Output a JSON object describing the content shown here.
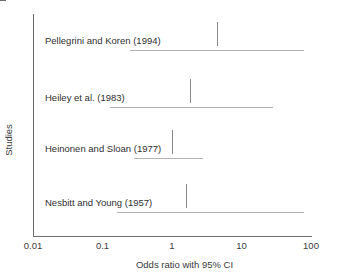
{
  "chart_data": {
    "type": "bar",
    "plot_kind": "forest-plot",
    "title": "",
    "xlabel": "Odds ratio with 95% CI",
    "ylabel": "Studies",
    "xscale": "log",
    "xlim": [
      0.01,
      100
    ],
    "xticks": [
      "0.01",
      "0.1",
      "1",
      "10",
      "100"
    ],
    "xtick_values": [
      0.01,
      0.1,
      1,
      100
    ],
    "grid": false,
    "legend": false,
    "categories": [
      "Pellegrini and Koren (1994)",
      "Heiley et al. (1983)",
      "Heinonen and Sloan (1977)",
      "Nesbitt and Young (1957)"
    ],
    "values": [
      4.5,
      1.8,
      1.0,
      1.6
    ],
    "series": [
      {
        "name": "Odds ratio with 95% CI",
        "points": [
          {
            "study": "Pellegrini and Koren (1994)",
            "odds_ratio": 4.5,
            "ci_low": 0.25,
            "ci_high": 80
          },
          {
            "study": "Heiley et al. (1983)",
            "odds_ratio": 1.8,
            "ci_low": 0.13,
            "ci_high": 28
          },
          {
            "study": "Heinonen and Sloan (1977)",
            "odds_ratio": 1.0,
            "ci_low": 0.28,
            "ci_high": 2.8
          },
          {
            "study": "Nesbitt and Young (1957)",
            "odds_ratio": 1.6,
            "ci_low": 0.16,
            "ci_high": 80
          }
        ]
      }
    ],
    "colors": {
      "axis": "#6e6e6e",
      "ci_line": "#b4b4b4",
      "point_tick": "#8a8a8a",
      "text": "#2f2f2f",
      "background": "#ffffff"
    }
  },
  "axes": {
    "y_title": "Studies",
    "x_title": "Odds ratio with 95% CI",
    "x_ticks": [
      {
        "label": "0.01",
        "value": 0.01
      },
      {
        "label": "0.1",
        "value": 0.1
      },
      {
        "label": "1",
        "value": 1
      },
      {
        "label": "10",
        "value": 10
      },
      {
        "label": "100",
        "value": 100
      }
    ]
  },
  "studies": [
    {
      "label": "Pellegrini and Koren (1994)",
      "odds_ratio": 4.5,
      "ci_low": 0.25,
      "ci_high": 80
    },
    {
      "label": "Heiley et al. (1983)",
      "odds_ratio": 1.8,
      "ci_low": 0.13,
      "ci_high": 28
    },
    {
      "label": "Heinonen and Sloan (1977)",
      "odds_ratio": 1.0,
      "ci_low": 0.28,
      "ci_high": 2.8
    },
    {
      "label": "Nesbitt and Young (1957)",
      "odds_ratio": 1.6,
      "ci_low": 0.16,
      "ci_high": 80
    }
  ]
}
